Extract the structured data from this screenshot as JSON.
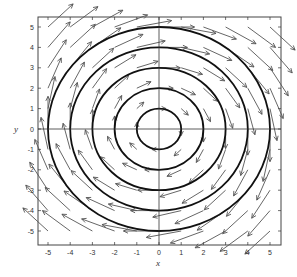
{
  "chart_data": {
    "type": "vector-field",
    "title": "",
    "xlabel": "x",
    "ylabel": "y",
    "xlim": [
      -5.5,
      5.5
    ],
    "ylim": [
      -5.5,
      5.5
    ],
    "x_ticks": [
      -5,
      -4,
      -3,
      -2,
      -1,
      0,
      1,
      2,
      3,
      4,
      5
    ],
    "y_ticks": [
      -5,
      -4,
      -3,
      -2,
      -1,
      0,
      1,
      2,
      3,
      4,
      5
    ],
    "grid": false,
    "axes_through_origin": true,
    "field": {
      "u": "y",
      "v": "-x",
      "rotation": "clockwise",
      "grid_spacing": 1,
      "grid_range": [
        -5,
        5
      ]
    },
    "circles": [
      {
        "cx": 0,
        "cy": 0,
        "r": 1
      },
      {
        "cx": 0,
        "cy": 0,
        "r": 2
      },
      {
        "cx": 0,
        "cy": 0,
        "r": 3
      },
      {
        "cx": 0,
        "cy": 0,
        "r": 4
      },
      {
        "cx": 0,
        "cy": 0,
        "r": 5
      }
    ],
    "legend": null
  },
  "colors": {
    "axis": "#333333",
    "arrow": "#555555",
    "circle": "#111111"
  }
}
